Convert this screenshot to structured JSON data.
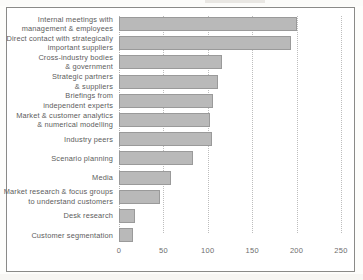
{
  "chart_data": {
    "type": "bar",
    "orientation": "horizontal",
    "title": "",
    "xlabel": "",
    "ylabel": "",
    "xlim": [
      0,
      250
    ],
    "xticks": [
      0,
      50,
      100,
      150,
      200,
      250
    ],
    "tick_labels": [
      "0",
      "50",
      "100",
      "150",
      "200",
      "250"
    ],
    "grid": true,
    "grid_style": "dotted vertical",
    "legend": "none",
    "bar_color": "#b9b9b9",
    "bar_border_color": "#9a9a9a",
    "categories": [
      "Internal meetings with\nmanagement & employees",
      "Direct contact with strategically\nimportant suppliers",
      "Cross-industry bodies\n& government",
      "Strategic partners\n& suppliers",
      "Briefings from\nindependent experts",
      "Market & customer analytics\n& numerical modelling",
      "Industry peers",
      "Scenario planning",
      "Media",
      "Market research & focus groups\nto understand customers",
      "Desk research",
      "Customer segmentation"
    ],
    "values": [
      200,
      194,
      116,
      112,
      106,
      103,
      105,
      83,
      58,
      46,
      18,
      16
    ]
  }
}
